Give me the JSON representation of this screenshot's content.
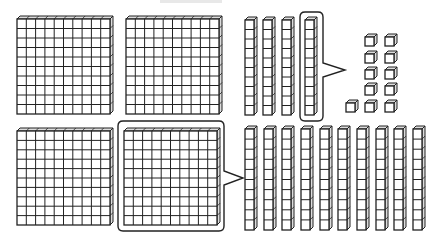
{
  "diagram": {
    "colors": {
      "stroke": "#222222",
      "fill": "#ffffff",
      "side": "#dddddd",
      "artifact": "#e8e8e8"
    },
    "top_group": {
      "flats": [
        {
          "x": 17,
          "y": 16,
          "w": 96,
          "h": 98
        },
        {
          "x": 126,
          "y": 16,
          "w": 96,
          "h": 98
        }
      ],
      "rods": [
        {
          "x": 245,
          "y": 17,
          "w": 12,
          "h": 98
        },
        {
          "x": 263,
          "y": 17,
          "w": 12,
          "h": 98
        },
        {
          "x": 282,
          "y": 17,
          "w": 12,
          "h": 98
        },
        {
          "x": 305,
          "y": 17,
          "w": 12,
          "h": 98
        }
      ],
      "highlight": {
        "x": 300,
        "y": 12,
        "w": 23,
        "h": 109,
        "callout_tip": [
          345,
          70
        ],
        "callout_y": [
          63,
          77
        ]
      },
      "units": [
        {
          "x": 365,
          "y": 34
        },
        {
          "x": 385,
          "y": 34
        },
        {
          "x": 365,
          "y": 51
        },
        {
          "x": 385,
          "y": 51
        },
        {
          "x": 365,
          "y": 67
        },
        {
          "x": 385,
          "y": 67
        },
        {
          "x": 365,
          "y": 83
        },
        {
          "x": 385,
          "y": 83
        },
        {
          "x": 346,
          "y": 100
        },
        {
          "x": 365,
          "y": 100
        },
        {
          "x": 385,
          "y": 100
        }
      ]
    },
    "bottom_group": {
      "flats": [
        {
          "x": 17,
          "y": 128,
          "w": 96,
          "h": 97
        },
        {
          "x": 124,
          "y": 128,
          "w": 96,
          "h": 97
        }
      ],
      "highlight": {
        "x": 118,
        "y": 121,
        "w": 106,
        "h": 110,
        "callout_tip": [
          243,
          178
        ],
        "callout_y": [
          171,
          185
        ]
      },
      "rods": [
        {
          "x": 245,
          "y": 126,
          "w": 12,
          "h": 104
        },
        {
          "x": 264,
          "y": 126,
          "w": 12,
          "h": 104
        },
        {
          "x": 282,
          "y": 126,
          "w": 12,
          "h": 104
        },
        {
          "x": 301,
          "y": 126,
          "w": 12,
          "h": 104
        },
        {
          "x": 320,
          "y": 126,
          "w": 12,
          "h": 104
        },
        {
          "x": 338,
          "y": 126,
          "w": 12,
          "h": 104
        },
        {
          "x": 357,
          "y": 126,
          "w": 12,
          "h": 104
        },
        {
          "x": 376,
          "y": 126,
          "w": 12,
          "h": 104
        },
        {
          "x": 394,
          "y": 126,
          "w": 12,
          "h": 104
        },
        {
          "x": 413,
          "y": 126,
          "w": 12,
          "h": 104
        }
      ]
    },
    "counts": {
      "top_hundreds": 2,
      "top_tens": 4,
      "top_ones": 11,
      "bottom_hundreds": 2,
      "bottom_tens": 10
    }
  }
}
